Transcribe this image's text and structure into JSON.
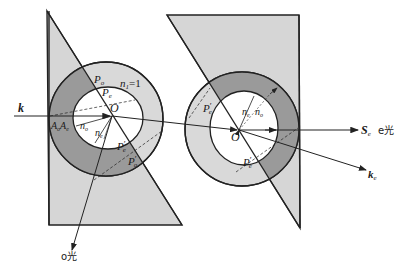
{
  "diagram": {
    "colors": {
      "prism_fill": "#d6d6d6",
      "ring_dark": "#9a9a9a",
      "ring_light": "#d2d2d2",
      "inner_white": "#ffffff",
      "stroke": "#222222"
    },
    "left_prism": {
      "labels": {
        "Po": "P",
        "Po_sub": "o",
        "Pe": "P",
        "Pe_sub": "e",
        "n1": "n",
        "n1_sub": "1",
        "n1_eq": "=1",
        "O": "O",
        "Ao": "A",
        "Ao_sub": "o",
        "Ae": "A",
        "Ae_sub": "e",
        "no": "n",
        "no_sub": "o",
        "ne": "n",
        "ne_sub": "e",
        "Pe_prime": "P",
        "Pe_prime_sub": "e",
        "Po_prime": "P",
        "Po_prime_sub": "o",
        "prime": "′"
      }
    },
    "right_prism": {
      "labels": {
        "Pe_prime": "P",
        "Pe_prime_sub": "e",
        "ne": "n",
        "ne_sub": "e",
        "no": "n",
        "no_sub": "o",
        "O": "O",
        "Pe_prime_lower": "P",
        "Pe_prime_lower_sub": "e",
        "prime": "′"
      }
    },
    "rays": {
      "incident": "k",
      "o_ray": "o光",
      "e_ray_S": "S",
      "e_ray_S_sub": "e",
      "e_ray": "e光",
      "e_ray_k": "k",
      "e_ray_k_sub": "e"
    }
  }
}
